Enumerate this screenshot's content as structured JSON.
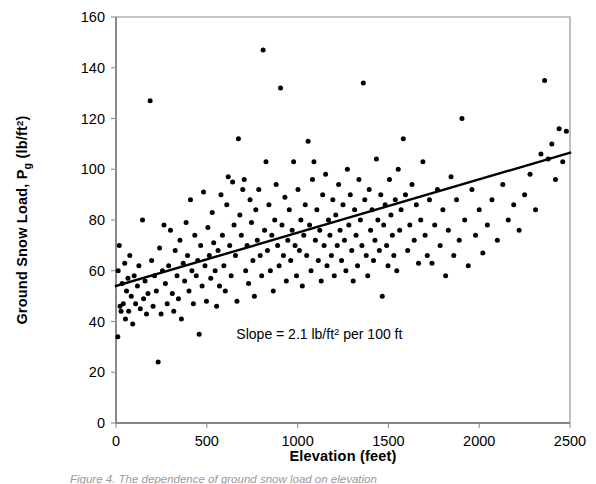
{
  "figure": {
    "caption_partial": "Figure 4.  The dependence of ground snow load on elevation"
  },
  "chart_data": {
    "type": "scatter",
    "title": "",
    "xlabel": "Elevation (feet)",
    "ylabel_parts": {
      "main": "Ground Snow Load, P",
      "subscript": "g",
      "units_open": " (lb/ft",
      "units_exp": "2",
      "units_close": ")"
    },
    "ylabel": "Ground Snow Load, Pg (lb/ft2)",
    "xlim": [
      0,
      2500
    ],
    "ylim": [
      0,
      160
    ],
    "xticks": [
      0,
      500,
      1000,
      1500,
      2000,
      2500
    ],
    "yticks": [
      0,
      20,
      40,
      60,
      80,
      100,
      120,
      140,
      160
    ],
    "grid": false,
    "legend": null,
    "marker": {
      "shape": "circle",
      "color": "#000000",
      "size_px": 5
    },
    "annotations": [
      {
        "name": "slope-annotation",
        "text_prefix": "Slope = 2.1 lb/ft",
        "text_exp": "2",
        "text_suffix": " per 100 ft",
        "text": "Slope = 2.1 lb/ft2 per 100 ft",
        "x": 1120,
        "y": 33
      }
    ],
    "trendline": {
      "name": "regression-line",
      "type": "linear",
      "slope_per_100ft": 2.1,
      "intercept": 54,
      "x0": 0,
      "y0": 54,
      "x1": 2500,
      "y1": 106.5,
      "color": "#000000",
      "width_px": 2.4
    },
    "axis_color": "#8c8c8c",
    "points": [
      [
        10,
        34
      ],
      [
        12,
        60
      ],
      [
        18,
        70
      ],
      [
        22,
        46
      ],
      [
        28,
        44
      ],
      [
        34,
        55
      ],
      [
        40,
        47
      ],
      [
        48,
        63
      ],
      [
        52,
        41
      ],
      [
        58,
        52
      ],
      [
        66,
        57
      ],
      [
        70,
        44
      ],
      [
        76,
        66
      ],
      [
        84,
        50
      ],
      [
        92,
        39
      ],
      [
        100,
        58
      ],
      [
        108,
        47
      ],
      [
        118,
        54
      ],
      [
        126,
        62
      ],
      [
        134,
        45
      ],
      [
        146,
        80
      ],
      [
        152,
        49
      ],
      [
        160,
        56
      ],
      [
        168,
        43
      ],
      [
        176,
        51
      ],
      [
        188,
        127
      ],
      [
        196,
        64
      ],
      [
        204,
        46
      ],
      [
        212,
        58
      ],
      [
        222,
        52
      ],
      [
        232,
        24
      ],
      [
        240,
        69
      ],
      [
        248,
        43
      ],
      [
        256,
        60
      ],
      [
        264,
        78
      ],
      [
        272,
        55
      ],
      [
        282,
        47
      ],
      [
        290,
        62
      ],
      [
        300,
        76
      ],
      [
        310,
        51
      ],
      [
        318,
        44
      ],
      [
        326,
        68
      ],
      [
        336,
        58
      ],
      [
        344,
        49
      ],
      [
        352,
        72
      ],
      [
        360,
        41
      ],
      [
        370,
        63
      ],
      [
        378,
        56
      ],
      [
        386,
        79
      ],
      [
        394,
        66
      ],
      [
        402,
        52
      ],
      [
        410,
        88
      ],
      [
        418,
        60
      ],
      [
        426,
        47
      ],
      [
        434,
        74
      ],
      [
        442,
        58
      ],
      [
        450,
        64
      ],
      [
        458,
        35
      ],
      [
        466,
        70
      ],
      [
        474,
        54
      ],
      [
        482,
        91
      ],
      [
        490,
        62
      ],
      [
        498,
        48
      ],
      [
        506,
        77
      ],
      [
        514,
        66
      ],
      [
        522,
        57
      ],
      [
        530,
        83
      ],
      [
        538,
        71
      ],
      [
        546,
        60
      ],
      [
        554,
        46
      ],
      [
        562,
        68
      ],
      [
        570,
        54
      ],
      [
        578,
        90
      ],
      [
        586,
        74
      ],
      [
        594,
        62
      ],
      [
        602,
        52
      ],
      [
        610,
        86
      ],
      [
        618,
        97
      ],
      [
        626,
        70
      ],
      [
        634,
        58
      ],
      [
        642,
        95
      ],
      [
        650,
        78
      ],
      [
        658,
        66
      ],
      [
        666,
        48
      ],
      [
        674,
        112
      ],
      [
        682,
        82
      ],
      [
        690,
        74
      ],
      [
        698,
        92
      ],
      [
        706,
        96
      ],
      [
        714,
        60
      ],
      [
        722,
        70
      ],
      [
        730,
        55
      ],
      [
        738,
        88
      ],
      [
        746,
        79
      ],
      [
        754,
        64
      ],
      [
        762,
        50
      ],
      [
        770,
        84
      ],
      [
        778,
        72
      ],
      [
        786,
        92
      ],
      [
        794,
        66
      ],
      [
        802,
        58
      ],
      [
        810,
        147
      ],
      [
        818,
        76
      ],
      [
        826,
        103
      ],
      [
        834,
        68
      ],
      [
        842,
        86
      ],
      [
        850,
        60
      ],
      [
        858,
        74
      ],
      [
        866,
        52
      ],
      [
        874,
        80
      ],
      [
        882,
        94
      ],
      [
        890,
        70
      ],
      [
        898,
        62
      ],
      [
        906,
        132
      ],
      [
        914,
        78
      ],
      [
        922,
        66
      ],
      [
        930,
        89
      ],
      [
        938,
        56
      ],
      [
        946,
        72
      ],
      [
        954,
        84
      ],
      [
        962,
        64
      ],
      [
        970,
        76
      ],
      [
        978,
        103
      ],
      [
        986,
        70
      ],
      [
        994,
        58
      ],
      [
        1002,
        92
      ],
      [
        1010,
        68
      ],
      [
        1018,
        80
      ],
      [
        1026,
        54
      ],
      [
        1034,
        74
      ],
      [
        1042,
        86
      ],
      [
        1050,
        66
      ],
      [
        1058,
        111
      ],
      [
        1066,
        78
      ],
      [
        1074,
        60
      ],
      [
        1082,
        96
      ],
      [
        1090,
        103
      ],
      [
        1098,
        72
      ],
      [
        1106,
        84
      ],
      [
        1114,
        64
      ],
      [
        1122,
        76
      ],
      [
        1130,
        56
      ],
      [
        1138,
        90
      ],
      [
        1146,
        70
      ],
      [
        1154,
        98
      ],
      [
        1162,
        62
      ],
      [
        1170,
        80
      ],
      [
        1178,
        74
      ],
      [
        1186,
        66
      ],
      [
        1194,
        88
      ],
      [
        1202,
        58
      ],
      [
        1210,
        82
      ],
      [
        1218,
        70
      ],
      [
        1226,
        94
      ],
      [
        1234,
        76
      ],
      [
        1242,
        64
      ],
      [
        1250,
        86
      ],
      [
        1258,
        72
      ],
      [
        1266,
        60
      ],
      [
        1274,
        100
      ],
      [
        1282,
        78
      ],
      [
        1290,
        90
      ],
      [
        1298,
        68
      ],
      [
        1306,
        56
      ],
      [
        1314,
        84
      ],
      [
        1322,
        74
      ],
      [
        1330,
        62
      ],
      [
        1338,
        96
      ],
      [
        1346,
        80
      ],
      [
        1354,
        70
      ],
      [
        1362,
        134
      ],
      [
        1370,
        88
      ],
      [
        1378,
        66
      ],
      [
        1386,
        58
      ],
      [
        1394,
        92
      ],
      [
        1402,
        76
      ],
      [
        1410,
        84
      ],
      [
        1418,
        64
      ],
      [
        1426,
        72
      ],
      [
        1434,
        104
      ],
      [
        1442,
        80
      ],
      [
        1450,
        68
      ],
      [
        1458,
        90
      ],
      [
        1466,
        50
      ],
      [
        1474,
        78
      ],
      [
        1482,
        86
      ],
      [
        1490,
        70
      ],
      [
        1498,
        62
      ],
      [
        1506,
        96
      ],
      [
        1514,
        82
      ],
      [
        1522,
        74
      ],
      [
        1530,
        66
      ],
      [
        1538,
        88
      ],
      [
        1546,
        60
      ],
      [
        1554,
        100
      ],
      [
        1562,
        76
      ],
      [
        1570,
        84
      ],
      [
        1582,
        112
      ],
      [
        1594,
        90
      ],
      [
        1606,
        68
      ],
      [
        1618,
        78
      ],
      [
        1630,
        94
      ],
      [
        1642,
        72
      ],
      [
        1654,
        86
      ],
      [
        1666,
        63
      ],
      [
        1678,
        80
      ],
      [
        1690,
        103
      ],
      [
        1702,
        74
      ],
      [
        1714,
        66
      ],
      [
        1726,
        88
      ],
      [
        1740,
        63
      ],
      [
        1755,
        78
      ],
      [
        1770,
        92
      ],
      [
        1785,
        70
      ],
      [
        1800,
        84
      ],
      [
        1815,
        58
      ],
      [
        1830,
        76
      ],
      [
        1845,
        97
      ],
      [
        1860,
        66
      ],
      [
        1875,
        88
      ],
      [
        1890,
        72
      ],
      [
        1905,
        120
      ],
      [
        1920,
        80
      ],
      [
        1940,
        62
      ],
      [
        1960,
        92
      ],
      [
        1980,
        74
      ],
      [
        2000,
        84
      ],
      [
        2020,
        67
      ],
      [
        2045,
        78
      ],
      [
        2070,
        88
      ],
      [
        2100,
        72
      ],
      [
        2130,
        94
      ],
      [
        2160,
        80
      ],
      [
        2190,
        86
      ],
      [
        2220,
        76
      ],
      [
        2250,
        90
      ],
      [
        2280,
        98
      ],
      [
        2310,
        84
      ],
      [
        2340,
        106
      ],
      [
        2360,
        135
      ],
      [
        2380,
        104
      ],
      [
        2400,
        110
      ],
      [
        2420,
        96
      ],
      [
        2440,
        116
      ],
      [
        2460,
        103
      ],
      [
        2480,
        115
      ]
    ]
  }
}
